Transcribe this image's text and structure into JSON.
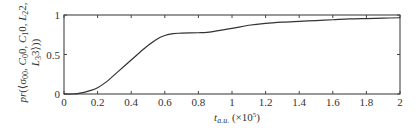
{
  "chart_data": {
    "type": "line",
    "title": "",
    "xlabel": "t_{a.u.} (×10^5)",
    "xlabel_parts": {
      "main": "t",
      "sub": "a.u.",
      "suffix": " (×10",
      "sup": "5",
      "close": ")"
    },
    "ylabel": "pr(⟨σ00, C00, C10, L22, L33⟩)",
    "ylabel_lines": [
      {
        "parts": [
          {
            "t": "pr",
            "it": true
          },
          {
            "t": "(⟨σ",
            "it": false
          },
          {
            "t": "00",
            "sub": true
          },
          {
            "t": ", ",
            "it": false
          },
          {
            "t": "C",
            "it": true
          },
          {
            "t": "0",
            "sub": true
          },
          {
            "t": "0, ",
            "it": false
          },
          {
            "t": "C",
            "it": true
          },
          {
            "t": "1",
            "sub": true
          },
          {
            "t": "0, ",
            "it": false
          },
          {
            "t": "L",
            "it": true
          },
          {
            "t": "2",
            "sub": true
          },
          {
            "t": "2,",
            "it": false
          }
        ]
      },
      {
        "parts": [
          {
            "t": "L",
            "it": true
          },
          {
            "t": "3",
            "sub": true
          },
          {
            "t": "3⟩))",
            "it": false
          }
        ]
      }
    ],
    "xlim": [
      0,
      2
    ],
    "ylim": [
      0,
      1
    ],
    "xticks": [
      0,
      0.2,
      0.4,
      0.6,
      0.8,
      1,
      1.2,
      1.4,
      1.6,
      1.8,
      2
    ],
    "xtick_labels": [
      "0",
      "0.2",
      "0.4",
      "0.6",
      "0.8",
      "1",
      "1.2",
      "1.4",
      "1.6",
      "1.8",
      "2"
    ],
    "yticks": [
      0,
      0.5,
      1
    ],
    "ytick_labels": [
      "0",
      "0.5",
      "1"
    ],
    "grid": false,
    "legend": null,
    "series": [
      {
        "name": "probability",
        "color": "#333333",
        "x": [
          0,
          0.05,
          0.08,
          0.12,
          0.16,
          0.2,
          0.25,
          0.32,
          0.4,
          0.48,
          0.55,
          0.6,
          0.65,
          0.7,
          0.8,
          0.85,
          0.9,
          1.0,
          1.1,
          1.2,
          1.3,
          1.4,
          1.5,
          1.6,
          1.7,
          1.8,
          1.9,
          2.0
        ],
        "y": [
          0,
          0,
          0.005,
          0.02,
          0.045,
          0.08,
          0.15,
          0.28,
          0.43,
          0.58,
          0.69,
          0.74,
          0.765,
          0.77,
          0.775,
          0.78,
          0.795,
          0.83,
          0.87,
          0.895,
          0.91,
          0.92,
          0.93,
          0.94,
          0.95,
          0.955,
          0.96,
          0.965
        ]
      }
    ]
  }
}
